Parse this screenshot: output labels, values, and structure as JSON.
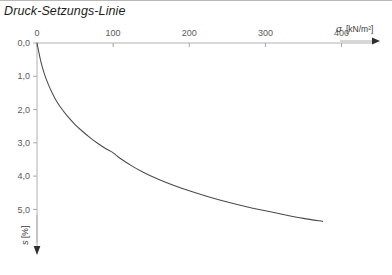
{
  "title": "Druck-Setzungs-Linie",
  "chart_data": {
    "type": "line",
    "title": "Druck-Setzungs-Linie",
    "xlabel": "σ [kN/m²]",
    "ylabel": "s [%]",
    "xlabel_symbol": "σ",
    "xlabel_unit": "[kN/m²]",
    "ylabel_symbol": "s",
    "ylabel_unit": "[%]",
    "x_axis_position": "top",
    "y_axis_direction": "down",
    "y_inverted": true,
    "grid": false,
    "legend": false,
    "xlim": [
      0,
      440
    ],
    "ylim": [
      0,
      5.8
    ],
    "xticks": [
      0,
      100,
      200,
      300,
      400
    ],
    "xticklabels": [
      "0",
      "100",
      "200",
      "300",
      "400"
    ],
    "yticks": [
      0.0,
      1.0,
      2.0,
      3.0,
      4.0,
      5.0
    ],
    "yticklabels": [
      "0,0",
      "1,0",
      "2,0",
      "3,0",
      "4,0",
      "5,0"
    ],
    "decimal_separator": ",",
    "series": [
      {
        "name": "Druck-Setzungs-Linie",
        "color": "#4a4a4a",
        "x": [
          0,
          5,
          10,
          15,
          20,
          25,
          30,
          40,
          50,
          60,
          70,
          80,
          90,
          100,
          110,
          125,
          140,
          160,
          180,
          200,
          225,
          250,
          275,
          300,
          325,
          350,
          375
        ],
        "y": [
          0.0,
          0.55,
          0.95,
          1.25,
          1.5,
          1.72,
          1.9,
          2.2,
          2.45,
          2.66,
          2.85,
          3.02,
          3.17,
          3.3,
          3.48,
          3.7,
          3.89,
          4.1,
          4.28,
          4.44,
          4.62,
          4.78,
          4.92,
          5.04,
          5.16,
          5.27,
          5.36
        ]
      }
    ],
    "annotations": [
      {
        "text": "inflection / slope change",
        "x": 100,
        "y": 3.3,
        "visible": false
      }
    ]
  },
  "colors": {
    "curve": "#4a4a4a",
    "axis": "#b0b0b0",
    "tick_label": "#5a5a5a",
    "title": "#1d1d1d",
    "background": "#ffffff",
    "rule": "#b9b9b9"
  }
}
